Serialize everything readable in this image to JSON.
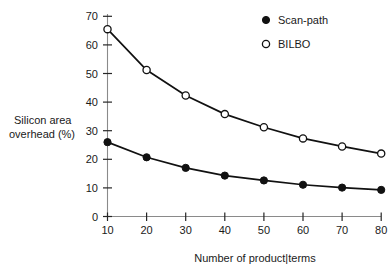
{
  "chart_data": {
    "type": "line",
    "title": "",
    "xlabel": "Number of product|terms",
    "ylabel_line1": "Silicon area",
    "ylabel_line2": "overhead (%)",
    "x": [
      10,
      20,
      30,
      40,
      50,
      60,
      70,
      80
    ],
    "xlim": [
      10,
      80
    ],
    "ylim": [
      0,
      70
    ],
    "xticks": [
      "10",
      "20",
      "30",
      "40",
      "50",
      "60",
      "70",
      "80"
    ],
    "yticks": [
      "0",
      "10",
      "20",
      "30",
      "40",
      "50",
      "60",
      "70"
    ],
    "grid": false,
    "legend_position": "top-right",
    "series": [
      {
        "name": "Scan-path",
        "marker": "filled-circle",
        "color": "#111111",
        "values": [
          26.0,
          20.7,
          17.0,
          14.3,
          12.6,
          11.1,
          10.1,
          9.3
        ]
      },
      {
        "name": "BILBO",
        "marker": "open-circle",
        "color": "#111111",
        "values": [
          65.5,
          51.2,
          42.3,
          35.8,
          31.2,
          27.3,
          24.5,
          22.0
        ]
      }
    ]
  },
  "legend": {
    "items": [
      {
        "label": "Scan-path",
        "marker": "filled-circle"
      },
      {
        "label": "BILBO",
        "marker": "open-circle"
      }
    ]
  },
  "axes": {
    "x_title": "Number of product|terms",
    "y_title_line1": "Silicon area",
    "y_title_line2": "overhead (%)"
  }
}
